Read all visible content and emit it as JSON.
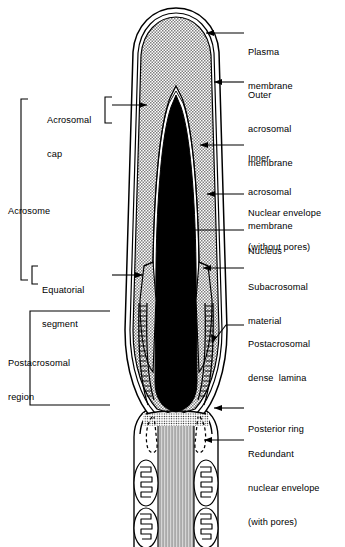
{
  "figure": {
    "colors": {
      "ink": "#000000",
      "background": "#ffffff",
      "nucleus_fill": "#000000",
      "acrosome_stipple": "#b3b3b3",
      "connecting_piece": "#c8c8c8"
    }
  },
  "right_labels": [
    {
      "id": "plasma-membrane",
      "lines": [
        "Plasma",
        "membrane"
      ]
    },
    {
      "id": "outer-acrosomal-membrane",
      "lines": [
        "Outer",
        "acrosomal",
        "membrane"
      ]
    },
    {
      "id": "inner-acrosomal-membrane",
      "lines": [
        "Inner",
        "acrosomal",
        "membrane"
      ]
    },
    {
      "id": "nuclear-envelope",
      "lines": [
        "Nuclear envelope",
        "(without pores)"
      ]
    },
    {
      "id": "nucleus",
      "lines": [
        "Nucleus"
      ]
    },
    {
      "id": "subacrosomal-material",
      "lines": [
        "Subacrosomal",
        "material"
      ]
    },
    {
      "id": "postacrosomal-dense-lamina",
      "lines": [
        "Postacrosomal",
        "dense  lamina"
      ]
    },
    {
      "id": "posterior-ring",
      "lines": [
        "Posterior ring"
      ]
    },
    {
      "id": "redundant-nuclear-envelope",
      "lines": [
        "Redundant",
        "nuclear envelope",
        "(with pores)"
      ]
    }
  ],
  "left_labels": [
    {
      "id": "acrosomal-cap",
      "lines": [
        "Acrosomal",
        "cap"
      ]
    },
    {
      "id": "acrosome",
      "lines": [
        "Acrosome"
      ]
    },
    {
      "id": "equatorial-segment",
      "lines": [
        "Equatorial",
        "segment"
      ]
    },
    {
      "id": "postacrosomal-region",
      "lines": [
        "Postacrosomal",
        "region"
      ]
    }
  ]
}
